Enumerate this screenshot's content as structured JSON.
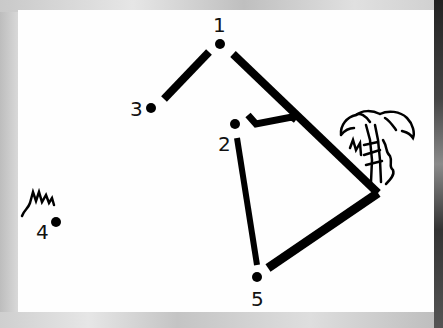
{
  "puzzle": {
    "type": "connect-the-dots",
    "dots": [
      {
        "label": "1",
        "x": 220,
        "y": 44
      },
      {
        "label": "2",
        "x": 235,
        "y": 124
      },
      {
        "label": "3",
        "x": 151,
        "y": 108
      },
      {
        "label": "4",
        "x": 56,
        "y": 222
      },
      {
        "label": "5",
        "x": 257,
        "y": 277
      }
    ],
    "colors": {
      "ink": "#000000",
      "paper": "#fefefe"
    }
  }
}
